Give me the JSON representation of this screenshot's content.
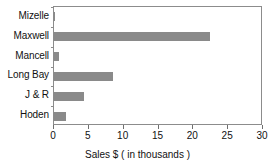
{
  "chart_data": {
    "type": "bar",
    "orientation": "horizontal",
    "title": "",
    "xlabel": "Sales $ ( in thousands )",
    "ylabel": "",
    "categories": [
      "Mizelle",
      "Maxwell",
      "Mancell",
      "Long Bay",
      "J & R",
      "Hoden"
    ],
    "values": [
      0.1,
      22.4,
      0.7,
      8.5,
      4.3,
      1.7
    ],
    "xlim": [
      0,
      30
    ],
    "xticks": [
      0,
      5,
      10,
      15,
      20,
      25,
      30
    ],
    "xtick_labels": [
      "0",
      "5",
      "10",
      "15",
      "20",
      "25",
      "30"
    ],
    "grid": false,
    "legend": null,
    "bar_color": "#8a8a8a",
    "frame_color": "#8c8c8c",
    "background": "#ffffff"
  }
}
